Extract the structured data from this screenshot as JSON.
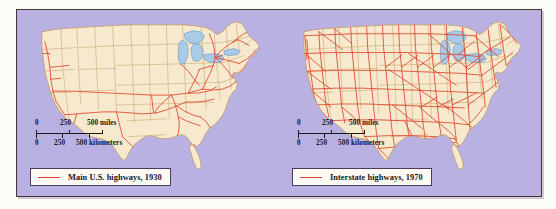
{
  "figure": {
    "background_color": "#b9b1e2",
    "frame_color": "#4a3535",
    "page_color": "#fdfcf7"
  },
  "colors": {
    "land": "#f6e9cd",
    "land_border": "#c9a36a",
    "state_border": "#c9a36a",
    "water": "#a9cbe8",
    "water_border": "#6f9fc8",
    "highway": "#e0442c",
    "background": "#b9b1e2",
    "legend_background": "#fdfbf4",
    "legend_border": "#4a3b5c",
    "text": "#17171c"
  },
  "panels": [
    {
      "id": "map-1930",
      "legend": {
        "label": "Main U.S. highways, 1930",
        "swatch_color": "#e0442c",
        "swatch_icon": "red-line-swatch"
      },
      "scale": {
        "miles": {
          "unit": "miles",
          "ticks": [
            "0",
            "250",
            "500"
          ]
        },
        "kilometers": {
          "unit": "kilometers",
          "ticks": [
            "0",
            "250",
            "500"
          ]
        }
      }
    },
    {
      "id": "map-1970",
      "legend": {
        "label": "Interstate highways, 1970",
        "swatch_color": "#e0442c",
        "swatch_icon": "red-line-swatch"
      },
      "scale": {
        "miles": {
          "unit": "miles",
          "ticks": [
            "0",
            "250",
            "500"
          ]
        },
        "kilometers": {
          "unit": "kilometers",
          "ticks": [
            "0",
            "250",
            "500"
          ]
        }
      }
    }
  ]
}
